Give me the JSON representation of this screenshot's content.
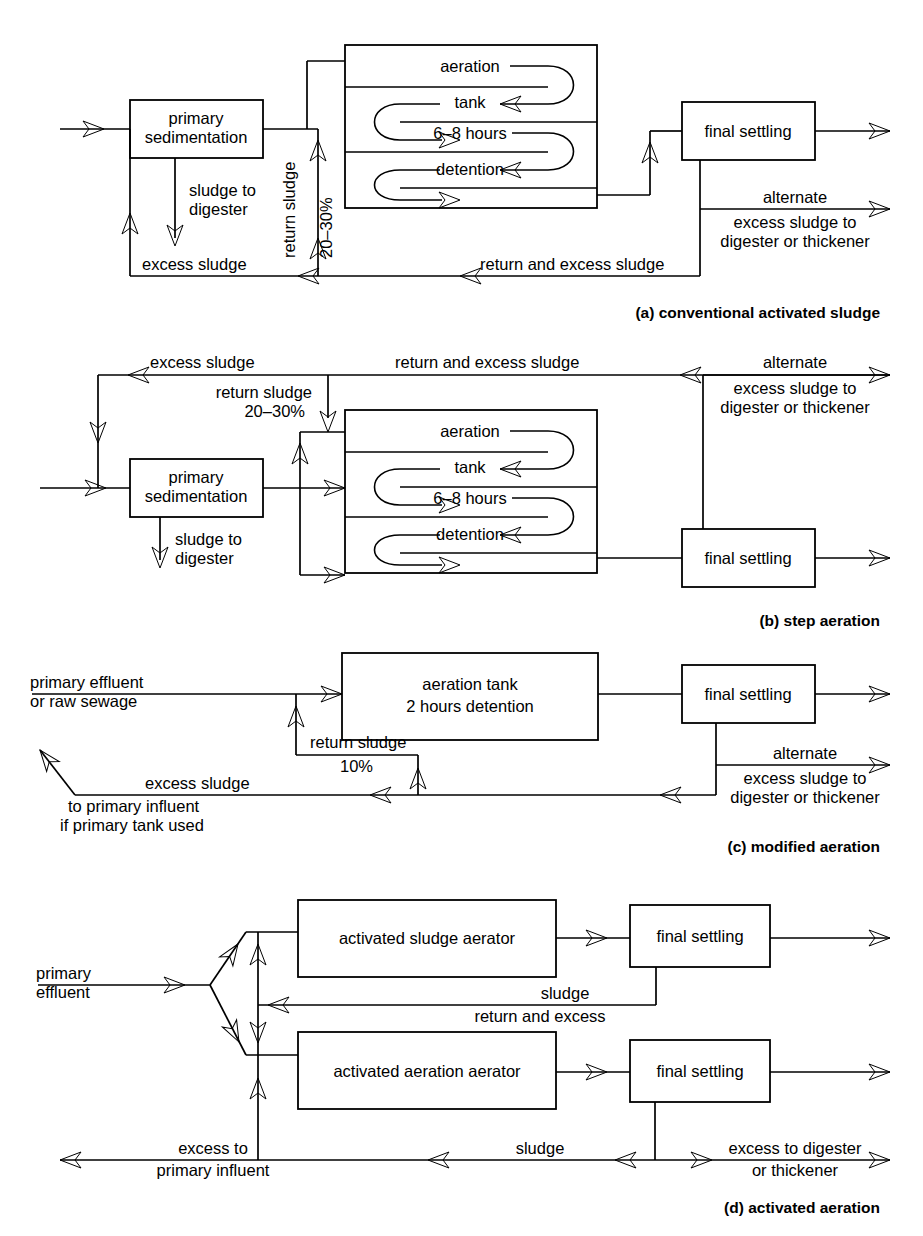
{
  "figure": {
    "panels": [
      {
        "id": "a",
        "caption": "(a) conventional activated sludge",
        "boxes": [
          {
            "name": "primary-sedimentation",
            "lines": [
              "primary",
              "sedimentation"
            ]
          },
          {
            "name": "aeration-tank",
            "lines": [
              "aeration",
              "tank",
              "6–8 hours",
              "detention"
            ]
          },
          {
            "name": "final-settling",
            "lines": [
              "final settling"
            ]
          }
        ],
        "labels": [
          {
            "name": "sludge-to-digester",
            "lines": [
              "sludge to",
              "digester"
            ]
          },
          {
            "name": "excess-sludge",
            "lines": [
              "excess sludge"
            ]
          },
          {
            "name": "return-sludge",
            "lines": [
              "return sludge"
            ]
          },
          {
            "name": "return-sludge-percent",
            "lines": [
              "20–30%"
            ]
          },
          {
            "name": "return-and-excess-sludge",
            "lines": [
              "return and excess sludge"
            ]
          },
          {
            "name": "alternate-excess-sludge",
            "lines": [
              "alternate",
              "excess sludge to",
              "digester or thickener"
            ]
          }
        ]
      },
      {
        "id": "b",
        "caption": "(b) step aeration",
        "boxes": [
          {
            "name": "primary-sedimentation",
            "lines": [
              "primary",
              "sedimentation"
            ]
          },
          {
            "name": "aeration-tank",
            "lines": [
              "aeration",
              "tank",
              "6–8 hours",
              "detention"
            ]
          },
          {
            "name": "final-settling",
            "lines": [
              "final settling"
            ]
          }
        ],
        "labels": [
          {
            "name": "excess-sludge",
            "lines": [
              "excess sludge"
            ]
          },
          {
            "name": "return-and-excess-sludge",
            "lines": [
              "return and excess sludge"
            ]
          },
          {
            "name": "return-sludge",
            "lines": [
              "return sludge",
              "20–30%"
            ]
          },
          {
            "name": "sludge-to-digester",
            "lines": [
              "sludge to",
              "digester"
            ]
          },
          {
            "name": "alternate-excess-sludge",
            "lines": [
              "alternate",
              "excess sludge to",
              "digester or thickener"
            ]
          }
        ]
      },
      {
        "id": "c",
        "caption": "(c) modified aeration",
        "boxes": [
          {
            "name": "aeration-tank",
            "lines": [
              "aeration tank",
              "2 hours detention"
            ]
          },
          {
            "name": "final-settling",
            "lines": [
              "final settling"
            ]
          }
        ],
        "labels": [
          {
            "name": "primary-effluent",
            "lines": [
              "primary effluent",
              "or raw sewage"
            ]
          },
          {
            "name": "return-sludge",
            "lines": [
              "return sludge",
              "10%"
            ]
          },
          {
            "name": "excess-sludge",
            "lines": [
              "excess sludge",
              "to primary influent",
              "if primary tank used"
            ]
          },
          {
            "name": "alternate-excess-sludge",
            "lines": [
              "alternate",
              "excess sludge to",
              "digester or thickener"
            ]
          }
        ]
      },
      {
        "id": "d",
        "caption": "(d) activated aeration",
        "boxes": [
          {
            "name": "activated-sludge-aerator",
            "lines": [
              "activated sludge aerator"
            ]
          },
          {
            "name": "final-settling-top",
            "lines": [
              "final settling"
            ]
          },
          {
            "name": "activated-aeration-aerator",
            "lines": [
              "activated aeration aerator"
            ]
          },
          {
            "name": "final-settling-bottom",
            "lines": [
              "final settling"
            ]
          }
        ],
        "labels": [
          {
            "name": "primary-effluent",
            "lines": [
              "primary",
              "effluent"
            ]
          },
          {
            "name": "sludge-return-and-excess",
            "lines": [
              "sludge",
              "return and excess"
            ]
          },
          {
            "name": "excess-to-primary-influent",
            "lines": [
              "excess to",
              "primary influent"
            ]
          },
          {
            "name": "sludge",
            "lines": [
              "sludge"
            ]
          },
          {
            "name": "excess-to-digester",
            "lines": [
              "excess to digester",
              "or thickener"
            ]
          }
        ]
      }
    ],
    "colors": {
      "ink": "#000000",
      "paper": "#ffffff"
    }
  },
  "panel_a": {
    "caption": "(a) conventional activated sludge",
    "box_primary_1": "primary",
    "box_primary_2": "sedimentation",
    "tank_1": "aeration",
    "tank_2": "tank",
    "tank_3": "6–8 hours",
    "tank_4": "detention",
    "box_final": "final settling",
    "sludge_digester_1": "sludge to",
    "sludge_digester_2": "digester",
    "excess_sludge": "excess sludge",
    "return_sludge": "return sludge",
    "return_pct": "20–30%",
    "return_excess": "return and excess sludge",
    "alt_1": "alternate",
    "alt_2": "excess sludge to",
    "alt_3": "digester or thickener"
  },
  "panel_b": {
    "caption": "(b) step aeration",
    "box_primary_1": "primary",
    "box_primary_2": "sedimentation",
    "tank_1": "aeration",
    "tank_2": "tank",
    "tank_3": "6–8 hours",
    "tank_4": "detention",
    "box_final": "final settling",
    "excess_sludge": "excess sludge",
    "return_excess": "return and excess sludge",
    "return_sludge": "return sludge",
    "return_pct": "20–30%",
    "sludge_digester_1": "sludge to",
    "sludge_digester_2": "digester",
    "alt_1": "alternate",
    "alt_2": "excess sludge to",
    "alt_3": "digester or thickener"
  },
  "panel_c": {
    "caption": "(c) modified aeration",
    "tank_1": "aeration tank",
    "tank_2": "2 hours detention",
    "box_final": "final settling",
    "influent_1": "primary effluent",
    "influent_2": "or raw sewage",
    "return_sludge": "return sludge",
    "return_pct": "10%",
    "excess_sludge": "excess sludge",
    "excess_2": "to primary influent",
    "excess_3": "if primary tank used",
    "alt_1": "alternate",
    "alt_2": "excess sludge to",
    "alt_3": "digester or thickener"
  },
  "panel_d": {
    "caption": "(d) activated aeration",
    "box_top": "activated sludge aerator",
    "box_bottom": "activated aeration aerator",
    "final_top": "final settling",
    "final_bottom": "final settling",
    "influent_1": "primary",
    "influent_2": "effluent",
    "sludge_top": "sludge",
    "return_excess": "return and excess",
    "excess_to_1": "excess to",
    "excess_to_2": "primary influent",
    "sludge_bottom": "sludge",
    "excess_dig_1": "excess to digester",
    "excess_dig_2": "or thickener"
  }
}
